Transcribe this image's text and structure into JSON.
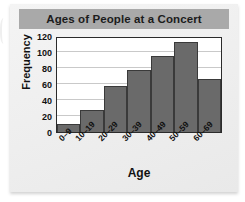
{
  "card": {
    "title": "Ages of People at a Concert"
  },
  "chart_data": {
    "type": "bar",
    "title": "Ages of People at a Concert",
    "xlabel": "Age",
    "ylabel": "Frequency",
    "categories": [
      "0–9",
      "10–19",
      "20–29",
      "30–39",
      "40–49",
      "50–59",
      "60–69"
    ],
    "values": [
      10,
      28,
      57,
      78,
      95,
      113,
      66
    ],
    "ylim": [
      0,
      120
    ],
    "yticks": [
      0,
      20,
      40,
      60,
      80,
      100,
      120
    ],
    "ytick_labels": [
      "0",
      "20",
      "40",
      "60",
      "80",
      "100",
      "120"
    ],
    "grid": true,
    "legend": null,
    "bar_color": "#6a6a6a",
    "bar_border_color": "#3a3a3a",
    "banner_color": "#a9a9a9",
    "plot_bg": "#ffffff",
    "grid_color": "#c9c9c9"
  }
}
